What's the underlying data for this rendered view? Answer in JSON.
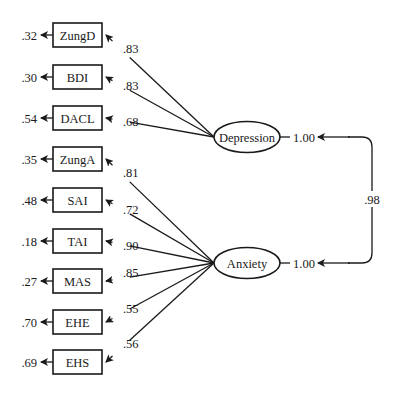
{
  "diagram": {
    "type": "structural-equation-model",
    "factors": [
      {
        "id": "depression",
        "label": "Depression",
        "variance": "1.00",
        "cx": 247,
        "cy": 137
      },
      {
        "id": "anxiety",
        "label": "Anxiety",
        "variance": "1.00",
        "cx": 247,
        "cy": 263
      }
    ],
    "factor_correlation": ".98",
    "indicators": [
      {
        "label": "ZungD",
        "error": ".32",
        "loading": ".83",
        "factor": "depression",
        "cy": 35
      },
      {
        "label": "BDI",
        "error": ".30",
        "loading": ".83",
        "factor": "depression",
        "cy": 77
      },
      {
        "label": "DACL",
        "error": ".54",
        "loading": ".68",
        "factor": "depression",
        "cy": 118
      },
      {
        "label": "ZungA",
        "error": ".35",
        "loading": ".81",
        "factor": "anxiety",
        "cy": 159
      },
      {
        "label": "SAI",
        "error": ".48",
        "loading": ".72",
        "factor": "anxiety",
        "cy": 200
      },
      {
        "label": "TAI",
        "error": ".18",
        "loading": ".90",
        "factor": "anxiety",
        "cy": 241
      },
      {
        "label": "MAS",
        "error": ".27",
        "loading": ".85",
        "factor": "anxiety",
        "cy": 281
      },
      {
        "label": "EHE",
        "error": ".70",
        "loading": ".55",
        "factor": "anxiety",
        "cy": 322
      },
      {
        "label": "EHS",
        "error": ".69",
        "loading": ".56",
        "factor": "anxiety",
        "cy": 362
      }
    ],
    "colors": {
      "ink": "#1a1a1a",
      "background": "#ffffff"
    }
  }
}
